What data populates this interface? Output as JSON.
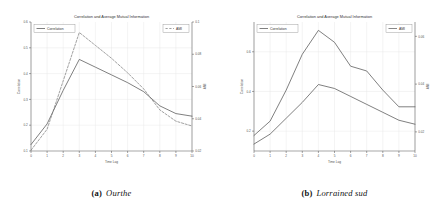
{
  "figure": {
    "panels": [
      {
        "key": "a",
        "caption_label": "(a)",
        "caption_text": "Ourthe",
        "chart_data": {
          "type": "line",
          "title": "Correlation and Average Mutual Information",
          "xlabel": "Time Lag",
          "ylabel": "Correlation",
          "y2label": "AMI",
          "grid": true,
          "legend_position": "top-left and top-right",
          "x": [
            0,
            1,
            2,
            3,
            4,
            5,
            6,
            7,
            8,
            9,
            10
          ],
          "xlim": [
            0,
            10
          ],
          "xticks": [
            "0",
            "1",
            "2",
            "3",
            "4",
            "5",
            "6",
            "7",
            "8",
            "9",
            "10"
          ],
          "ylim": [
            0.1,
            0.6
          ],
          "yticks": [
            "0.1",
            "0.2",
            "0.3",
            "0.4",
            "0.5",
            "0.6"
          ],
          "y2lim": [
            0.02,
            0.1
          ],
          "y2ticks": [
            "0.02",
            "0.04",
            "0.06",
            "0.08",
            "0.1"
          ],
          "series": [
            {
              "name": "Correlation",
              "axis": "left",
              "style": "solid",
              "color": "#555555",
              "values": [
                0.125,
                0.205,
                0.335,
                0.455,
                0.425,
                0.395,
                0.365,
                0.33,
                0.275,
                0.245,
                0.235
              ]
            },
            {
              "name": "AMI",
              "axis": "right",
              "style": "dashed",
              "color": "#777777",
              "values": [
                0.0205,
                0.0335,
                0.0635,
                0.0935,
                0.0855,
                0.0775,
                0.0685,
                0.0585,
                0.0455,
                0.0385,
                0.0355
              ]
            }
          ]
        }
      },
      {
        "key": "b",
        "caption_label": "(b)",
        "caption_text": "Lorrained sud",
        "chart_data": {
          "type": "line",
          "title": "Correlation and Average Mutual Information",
          "xlabel": "Time Lag",
          "ylabel": "Correlation",
          "y2label": "AMI",
          "grid": true,
          "legend_position": "top-left and top-right",
          "x": [
            0,
            1,
            2,
            3,
            4,
            5,
            6,
            7,
            8,
            9,
            10
          ],
          "xlim": [
            0,
            10
          ],
          "xticks": [
            "0",
            "1",
            "2",
            "3",
            "4",
            "5",
            "6",
            "7",
            "8",
            "9",
            "10"
          ],
          "ylim": [
            0.1,
            0.75
          ],
          "yticks": [
            "0.2",
            "0.4",
            "0.6"
          ],
          "y2lim": [
            0.012,
            0.066
          ],
          "y2ticks": [
            "0.02",
            "0.04",
            "0.06"
          ],
          "series": [
            {
              "name": "Correlation",
              "axis": "left",
              "style": "solid",
              "color": "#555555",
              "values": [
                0.135,
                0.185,
                0.265,
                0.345,
                0.435,
                0.415,
                0.375,
                0.335,
                0.295,
                0.255,
                0.235
              ]
            },
            {
              "name": "AMI",
              "axis": "right",
              "style": "solid",
              "color": "#555555",
              "values": [
                0.0185,
                0.0245,
                0.0375,
                0.0525,
                0.0625,
                0.0575,
                0.0475,
                0.0455,
                0.0375,
                0.0305,
                0.0305
              ]
            }
          ]
        }
      }
    ]
  }
}
